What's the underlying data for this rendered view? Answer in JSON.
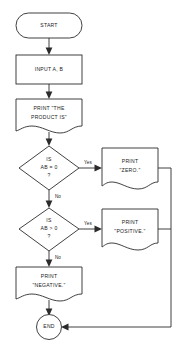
{
  "diagram": {
    "type": "flowchart",
    "orientation": "vertical",
    "background_color": "#ffffff",
    "line_color": "#2b2b2b",
    "text_color": "#1a1a1a",
    "nodes": [
      {
        "id": "start",
        "shape": "terminator",
        "label": "START",
        "lines": [
          "START"
        ]
      },
      {
        "id": "input",
        "shape": "process",
        "label": "INPUT A, B",
        "lines": [
          "INPUT A, B"
        ]
      },
      {
        "id": "print_product",
        "shape": "document",
        "label": "PRINT \"THE PRODUCT IS\"",
        "lines": [
          "PRINT \"THE",
          "PRODUCT IS\""
        ]
      },
      {
        "id": "decision_zero",
        "shape": "decision",
        "label": "IS AB = 0 ?",
        "lines": [
          "IS",
          "AB = 0",
          "?"
        ]
      },
      {
        "id": "print_zero",
        "shape": "document",
        "label": "PRINT \"ZERO.\"",
        "lines": [
          "PRINT",
          "\"ZERO.\""
        ]
      },
      {
        "id": "decision_positive",
        "shape": "decision",
        "label": "IS AB > 0 ?",
        "lines": [
          "IS",
          "AB > 0",
          "?"
        ]
      },
      {
        "id": "print_positive",
        "shape": "document",
        "label": "PRINT \"POSITIVE.\"",
        "lines": [
          "PRINT",
          "\"POSITIVE.\""
        ]
      },
      {
        "id": "print_negative",
        "shape": "document",
        "label": "PRINT \"NEGATIVE.\"",
        "lines": [
          "PRINT",
          "\"NEGATIVE.\""
        ]
      },
      {
        "id": "end",
        "shape": "circle",
        "label": "END",
        "lines": [
          "END"
        ]
      }
    ],
    "edges": [
      {
        "id": "e1",
        "from": "start",
        "to": "input",
        "label": ""
      },
      {
        "id": "e2",
        "from": "input",
        "to": "print_product",
        "label": ""
      },
      {
        "id": "e3",
        "from": "print_product",
        "to": "decision_zero",
        "label": ""
      },
      {
        "id": "e4",
        "from": "decision_zero",
        "to": "print_zero",
        "label": "Yes"
      },
      {
        "id": "e5",
        "from": "decision_zero",
        "to": "decision_positive",
        "label": "No"
      },
      {
        "id": "e6",
        "from": "decision_positive",
        "to": "print_positive",
        "label": "Yes"
      },
      {
        "id": "e7",
        "from": "decision_positive",
        "to": "print_negative",
        "label": "No"
      },
      {
        "id": "e8",
        "from": "print_negative",
        "to": "end",
        "label": ""
      },
      {
        "id": "e9",
        "from": "print_zero",
        "to": "end",
        "label": ""
      },
      {
        "id": "e10",
        "from": "print_positive",
        "to": "end",
        "label": ""
      }
    ]
  },
  "labels": {
    "start": "START",
    "input": "INPUT A, B",
    "print_product_l1": "PRINT \"THE",
    "print_product_l2": "PRODUCT IS\"",
    "decision_zero_l1": "IS",
    "decision_zero_l2": "AB = 0",
    "decision_zero_l3": "?",
    "print_zero_l1": "PRINT",
    "print_zero_l2": "\"ZERO.\"",
    "decision_positive_l1": "IS",
    "decision_positive_l2": "AB > 0",
    "decision_positive_l3": "?",
    "print_positive_l1": "PRINT",
    "print_positive_l2": "\"POSITIVE.\"",
    "print_negative_l1": "PRINT",
    "print_negative_l2": "\"NEGATIVE.\"",
    "end": "END",
    "yes_1": "Yes",
    "no_1": "No",
    "yes_2": "Yes",
    "no_2": "No"
  }
}
